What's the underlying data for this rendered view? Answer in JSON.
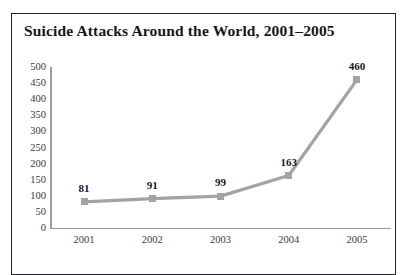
{
  "figure": {
    "border_color": "#23232a",
    "background": "#ffffff"
  },
  "title": "Suicide Attacks Around the World, 2001–2005",
  "chart_data": {
    "type": "line",
    "title": "Suicide Attacks Around the World, 2001–2005",
    "xlabel": "",
    "ylabel": "",
    "categories": [
      "2001",
      "2002",
      "2003",
      "2004",
      "2005"
    ],
    "values": [
      81,
      91,
      99,
      163,
      460
    ],
    "point_labels": [
      "81",
      "91",
      "99",
      "163",
      "460"
    ],
    "ylim": [
      0,
      500
    ],
    "y_ticks": [
      0,
      50,
      100,
      150,
      200,
      250,
      300,
      350,
      400,
      450,
      500
    ],
    "y_tick_labels": [
      "0",
      "50",
      "100",
      "150",
      "200",
      "250",
      "300",
      "350",
      "400",
      "450",
      "500"
    ],
    "grid": false,
    "legend": "none",
    "series_color": "#a3a3a3",
    "marker": "square",
    "marker_color": "#a3a3a3",
    "axis_color": "#9b9b9b",
    "tick_label_color": "#3a3a3f",
    "data_label_color": "#16161a"
  }
}
